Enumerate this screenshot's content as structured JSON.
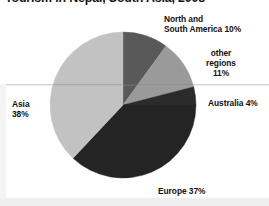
{
  "chart_data": {
    "type": "pie",
    "title": "Tourism in Nepal, South Asia, 2008",
    "xlabel": "",
    "ylabel": "",
    "legend": "none",
    "grid": false,
    "units": "percent",
    "start_angle_deg": 0,
    "direction": "clockwise",
    "categories": [
      "North and South America",
      "other regions",
      "Australia",
      "Europe",
      "Asia"
    ],
    "values": [
      10,
      11,
      4,
      37,
      38
    ],
    "labels": [
      "North and\nSouth America 10%",
      "other\nregions\n11%",
      "Australia 4%",
      "Europe 37%",
      "Asia\n38%"
    ],
    "colors": [
      "#595959",
      "#9a9a9a",
      "#2b2b2b",
      "#242424",
      "#c2c2c2"
    ],
    "slices": [
      {
        "name": "North and South America",
        "value": 10,
        "label": "North and\nSouth America 10%",
        "color": "#595959"
      },
      {
        "name": "other regions",
        "value": 11,
        "label": "other\nregions\n11%",
        "color": "#9a9a9a"
      },
      {
        "name": "Australia",
        "value": 4,
        "label": "Australia 4%",
        "color": "#2b2b2b"
      },
      {
        "name": "Europe",
        "value": 37,
        "label": "Europe 37%",
        "color": "#242424"
      },
      {
        "name": "Asia",
        "value": 38,
        "label": "Asia\n38%",
        "color": "#c2c2c2"
      }
    ]
  },
  "geometry": {
    "center_x": 123,
    "center_y": 105,
    "radius": 73
  }
}
